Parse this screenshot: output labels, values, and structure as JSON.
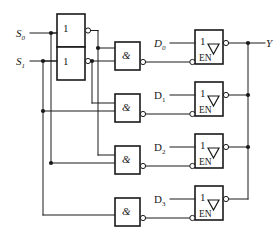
{
  "diagram": {
    "colors": {
      "line": "#1a1a1a",
      "fill": "#ffffff",
      "background": "#ffffff"
    }
  },
  "select_inputs": [
    {
      "name": "S0",
      "base": "S",
      "sub": "0",
      "y": 33
    },
    {
      "name": "S1",
      "base": "S",
      "sub": "1",
      "y": 61
    }
  ],
  "data_inputs": [
    {
      "name": "D0",
      "base": "D",
      "sub": "0",
      "italic": true,
      "y": 43
    },
    {
      "name": "D1",
      "base": "D",
      "sub": "1",
      "italic": false,
      "y": 94
    },
    {
      "name": "D2",
      "base": "D",
      "sub": "2",
      "italic": false,
      "y": 146
    },
    {
      "name": "D3",
      "base": "D",
      "sub": "3",
      "italic": false,
      "y": 198
    }
  ],
  "output": {
    "name": "Y",
    "label": "Y"
  },
  "inverters": [
    {
      "name": "inverter-s0",
      "label": "1",
      "x": 57,
      "y": 14,
      "w": 28,
      "h": 33
    },
    {
      "name": "inverter-s1",
      "label": "1",
      "x": 57,
      "y": 47,
      "w": 28,
      "h": 33
    }
  ],
  "and_gates": [
    {
      "name": "and-gate-0",
      "label": "&",
      "x": 115,
      "y": 42,
      "w": 25,
      "h": 28
    },
    {
      "name": "and-gate-1",
      "label": "&",
      "x": 115,
      "y": 94,
      "w": 25,
      "h": 28
    },
    {
      "name": "and-gate-2",
      "label": "&",
      "x": 115,
      "y": 146,
      "w": 25,
      "h": 28
    },
    {
      "name": "and-gate-3",
      "label": "&",
      "x": 115,
      "y": 198,
      "w": 25,
      "h": 28
    }
  ],
  "buffers": [
    {
      "name": "tri-state-buffer-0",
      "top_label": "1",
      "en_label": "EN",
      "x": 195,
      "y": 30,
      "w": 28,
      "h": 34
    },
    {
      "name": "tri-state-buffer-1",
      "top_label": "1",
      "en_label": "EN",
      "x": 195,
      "y": 82,
      "w": 28,
      "h": 34
    },
    {
      "name": "tri-state-buffer-2",
      "top_label": "1",
      "en_label": "EN",
      "x": 195,
      "y": 134,
      "w": 28,
      "h": 34
    },
    {
      "name": "tri-state-buffer-3",
      "top_label": "1",
      "en_label": "EN",
      "x": 195,
      "y": 186,
      "w": 28,
      "h": 34
    }
  ]
}
